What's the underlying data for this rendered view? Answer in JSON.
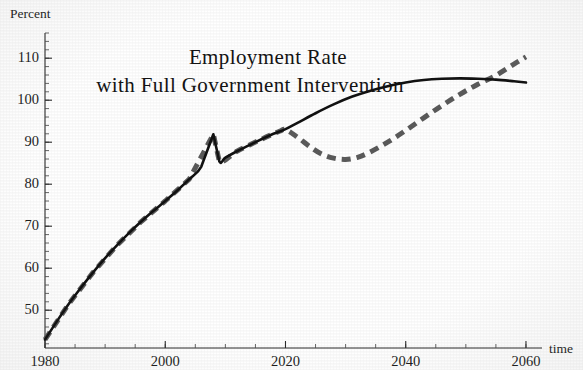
{
  "chart_data": {
    "type": "line",
    "title": "Employment Rate",
    "subtitle": "with Full Government Intervention",
    "xlabel": "time",
    "ylabel": "Percent",
    "xlim": [
      1980,
      2062
    ],
    "ylim": [
      41,
      116
    ],
    "grid": false,
    "legend": "none",
    "x_ticks": [
      1980,
      2000,
      2020,
      2040,
      2060
    ],
    "x_tick_labels": [
      "1980",
      "2000",
      "2020",
      "2040",
      "2060"
    ],
    "x_minor_step": 5,
    "y_ticks": [
      50,
      60,
      70,
      80,
      90,
      100,
      110
    ],
    "y_tick_labels": [
      "50",
      "60",
      "70",
      "80",
      "90",
      "100",
      "110"
    ],
    "y_minor_step": 2,
    "series": [
      {
        "name": "baseline-solid",
        "style": "solid",
        "color": "#121212",
        "x": [
          1980,
          1982,
          1984,
          1986,
          1988,
          1990,
          1992,
          1994,
          1996,
          1998,
          2000,
          2002,
          2004,
          2006,
          2008,
          2009,
          2010,
          2012,
          2014,
          2016,
          2018,
          2020,
          2022,
          2025,
          2028,
          2031,
          2034,
          2037,
          2040,
          2043,
          2046,
          2049,
          2052,
          2055,
          2058,
          2060
        ],
        "y": [
          43.0,
          47.4,
          51.6,
          55.4,
          59.0,
          62.4,
          65.5,
          68.4,
          71.1,
          73.6,
          76.0,
          78.5,
          81.2,
          84.2,
          91.9,
          85.4,
          86.3,
          87.9,
          89.3,
          90.7,
          92.0,
          93.1,
          94.6,
          96.9,
          99.0,
          100.8,
          102.2,
          103.3,
          104.2,
          104.8,
          105.1,
          105.2,
          105.1,
          104.9,
          104.5,
          104.2
        ]
      },
      {
        "name": "intervention-dashed",
        "style": "dashed",
        "color": "#5b5b5b",
        "x": [
          1980,
          1984,
          1988,
          1992,
          1996,
          2000,
          2004,
          2008,
          2009,
          2012,
          2016,
          2019,
          2020,
          2022,
          2024,
          2026,
          2028,
          2030,
          2032,
          2034,
          2037,
          2040,
          2043,
          2046,
          2049,
          2052,
          2055,
          2058,
          2060
        ],
        "y": [
          43.0,
          51.6,
          59.0,
          65.5,
          71.1,
          76.0,
          81.2,
          91.9,
          85.4,
          87.9,
          90.7,
          92.6,
          93.0,
          91.2,
          89.0,
          87.2,
          86.2,
          85.9,
          86.4,
          87.6,
          90.0,
          92.8,
          95.8,
          98.7,
          101.4,
          103.8,
          105.9,
          108.6,
          110.3
        ]
      }
    ],
    "annotations": []
  }
}
